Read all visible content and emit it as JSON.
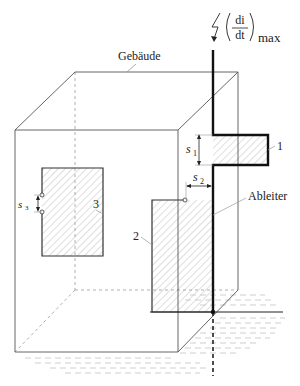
{
  "diagram": {
    "type": "lightning-protection-induction-loops",
    "labels": {
      "building": "Gebäude",
      "conductor": "Ableiter",
      "loop1": "1",
      "loop2": "2",
      "loop3": "3",
      "s1": "s",
      "s1_sub": "1",
      "s2": "s",
      "s2_sub": "2",
      "s3": "s",
      "s3_sub": "3",
      "formula_num": "di",
      "formula_den": "dt",
      "formula_sub": "max"
    },
    "colors": {
      "conductor": "#111111",
      "building_edges": "#666666",
      "hatch": "#bdbdbd",
      "ground": "#c8c8c8"
    }
  }
}
